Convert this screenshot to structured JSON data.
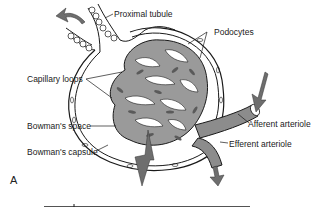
{
  "figure": {
    "panel_label": "A",
    "labels": {
      "proximal_tubule": "Proximal tubule",
      "podocytes": "Podocytes",
      "capillary_loops": "Capillary loops",
      "bowmans_space": "Bowman's space",
      "bowmans_capsule": "Bowman's capsule",
      "afferent_arteriole": "Afferent arteriole",
      "efferent_arteriole": "Efferent arteriole"
    },
    "colors": {
      "line": "#1a1a1a",
      "fill_gray": "#8c8c8c",
      "arrow_gray": "#6e6e6e",
      "background": "#ffffff"
    }
  }
}
